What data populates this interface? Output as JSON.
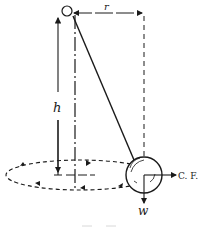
{
  "diagram": {
    "type": "conical-pendulum",
    "labels": {
      "radius": "r",
      "height": "h",
      "centrifugal_force": "C. F.",
      "weight": "w"
    },
    "colors": {
      "ink": "#1a1a1a",
      "background": "#ffffff",
      "caption": "#d8d8d8"
    }
  }
}
